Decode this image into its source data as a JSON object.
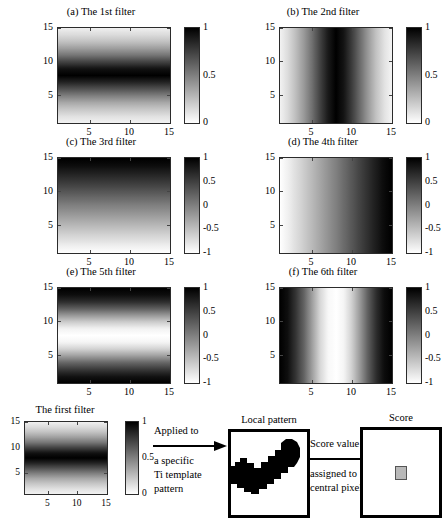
{
  "figure": {
    "width": 444,
    "height": 530,
    "background": "#ffffff",
    "ink": "#000000"
  },
  "chart_data": {
    "type": "heatmap",
    "colormap": "gray_reversed (0 = white, 1 = black)",
    "grid": false,
    "legend": "colorbar per panel, right side",
    "axis_common": {
      "xlabel": "",
      "ylabel": "",
      "xlim": [
        1,
        15
      ],
      "ylim": [
        1,
        15
      ],
      "xticks": [
        "5",
        "10",
        "15"
      ],
      "yticks": [
        "5",
        "10",
        "15"
      ],
      "xtick_values": [
        5,
        10,
        15
      ],
      "ytick_values": [
        5,
        10,
        15
      ],
      "size_pixels": [
        15,
        15
      ]
    },
    "panels": [
      {
        "id": "a",
        "label": "(a) The 1st filter",
        "orientation": "horizontal",
        "pattern": "single dark band centred near row 8, symmetric falloff",
        "clim": [
          0,
          1
        ],
        "cbar_ticks": [
          "1",
          "0.5",
          "0"
        ],
        "cbar_tick_values": [
          1,
          0.5,
          0
        ],
        "profile_axis": "y",
        "profile": [
          0.05,
          0.12,
          0.22,
          0.34,
          0.5,
          0.68,
          0.86,
          1.0,
          0.93,
          0.74,
          0.54,
          0.38,
          0.24,
          0.14,
          0.06
        ]
      },
      {
        "id": "b",
        "label": "(b) The 2nd filter",
        "orientation": "vertical",
        "pattern": "single dark band centred near column 8, symmetric falloff",
        "clim": [
          0,
          1
        ],
        "cbar_ticks": [
          "1",
          "0.5",
          "0"
        ],
        "cbar_tick_values": [
          1,
          0.5,
          0
        ],
        "profile_axis": "x",
        "profile": [
          0.05,
          0.14,
          0.26,
          0.4,
          0.56,
          0.74,
          0.9,
          1.0,
          0.92,
          0.76,
          0.58,
          0.4,
          0.24,
          0.12,
          0.04
        ]
      },
      {
        "id": "c",
        "label": "(c) The 3rd filter",
        "orientation": "horizontal",
        "pattern": "monotonic ramp, white at bottom to black at top",
        "clim": [
          -1,
          1
        ],
        "cbar_ticks": [
          "1",
          "0.5",
          "0",
          "-0.5",
          "-1"
        ],
        "cbar_tick_values": [
          1,
          0.5,
          0,
          -0.5,
          -1
        ],
        "profile_axis": "y",
        "profile": [
          -1.0,
          -0.88,
          -0.74,
          -0.6,
          -0.45,
          -0.3,
          -0.15,
          0.0,
          0.16,
          0.32,
          0.48,
          0.63,
          0.78,
          0.92,
          1.0
        ]
      },
      {
        "id": "d",
        "label": "(d) The 4th filter",
        "orientation": "vertical",
        "pattern": "monotonic ramp, white at left to black at right",
        "clim": [
          -1,
          1
        ],
        "cbar_ticks": [
          "1",
          "0.5",
          "0",
          "-0.5",
          "-1"
        ],
        "cbar_tick_values": [
          1,
          0.5,
          0,
          -0.5,
          -1
        ],
        "profile_axis": "x",
        "profile": [
          -1.0,
          -0.88,
          -0.74,
          -0.6,
          -0.45,
          -0.3,
          -0.15,
          0.0,
          0.16,
          0.32,
          0.48,
          0.63,
          0.78,
          0.92,
          1.0
        ]
      },
      {
        "id": "e",
        "label": "(e) The 5th filter",
        "orientation": "horizontal",
        "pattern": "black at top and bottom edges, white band at centre row 8",
        "clim": [
          -1,
          1
        ],
        "cbar_ticks": [
          "1",
          "0.5",
          "0",
          "-0.5",
          "-1"
        ],
        "cbar_tick_values": [
          1,
          0.5,
          0,
          -0.5,
          -1
        ],
        "profile_axis": "y",
        "profile": [
          1.0,
          0.85,
          0.55,
          0.2,
          -0.25,
          -0.65,
          -0.92,
          -1.0,
          -0.9,
          -0.6,
          -0.18,
          0.28,
          0.66,
          0.9,
          1.0
        ]
      },
      {
        "id": "f",
        "label": "(f) The 6th filter",
        "orientation": "vertical",
        "pattern": "black at left and right edges, white band at centre column 8",
        "clim": [
          -1,
          1
        ],
        "cbar_ticks": [
          "1",
          "0.5",
          "0",
          "-0.5",
          "-1"
        ],
        "cbar_tick_values": [
          1,
          0.5,
          0,
          -0.5,
          -1
        ],
        "profile_axis": "x",
        "profile": [
          1.0,
          0.88,
          0.58,
          0.22,
          -0.24,
          -0.68,
          -0.94,
          -1.0,
          -0.92,
          -0.62,
          -0.2,
          0.26,
          0.64,
          0.9,
          1.0
        ]
      }
    ]
  },
  "bottom_flow": {
    "filter": {
      "title": "The first filter",
      "xticks": [
        "5",
        "10",
        "15"
      ],
      "yticks": [
        "5",
        "10",
        "15"
      ],
      "clim": [
        0,
        1
      ],
      "cbar_ticks": [
        "1",
        "0.5",
        "0"
      ],
      "cbar_tick_values": [
        1,
        0.5,
        0
      ]
    },
    "arrow1": {
      "line1": "Applied to",
      "line2": "a specific",
      "line3": "Ti template",
      "line4": "pattern",
      "icon": "arrow-right-icon"
    },
    "local_pattern": {
      "title": "Local pattern",
      "description": "binary black-and-white local texture patch with a rising diagonal black band"
    },
    "arrow2": {
      "line1": "Score value",
      "line2": "assigned to",
      "line3": "central pixel",
      "icon": "arrow-right-icon"
    },
    "score": {
      "title": "Score",
      "center_pixel_color": "#b9b9b9",
      "description": "white patch with single shaded central pixel"
    }
  }
}
